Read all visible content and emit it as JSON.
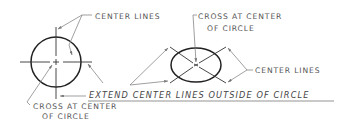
{
  "diagram": {
    "left_figure": {
      "shape": "circle",
      "labels": {
        "center_lines": "CENTER LINES",
        "cross_line1": "CROSS AT CENTER",
        "cross_line2": "OF CIRCLE"
      }
    },
    "right_figure": {
      "shape": "ellipse",
      "labels": {
        "cross_line1": "CROSS AT CENTER",
        "cross_line2": "OF CIRCLE",
        "center_lines": "CENTER LINES"
      }
    },
    "note": "EXTEND CENTER LINES OUTSIDE OF CIRCLE",
    "colors": {
      "ink": "#222222",
      "label": "#555555",
      "leader": "#777777"
    }
  }
}
